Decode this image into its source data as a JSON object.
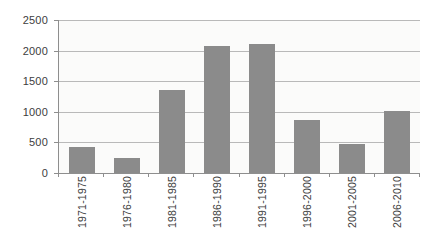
{
  "chart_data": {
    "type": "bar",
    "title": "",
    "xlabel": "",
    "ylabel": "",
    "categories": [
      "1971-1975",
      "1976-1980",
      "1981-1985",
      "1986-1990",
      "1991-1995",
      "1996-2000",
      "2001-2005",
      "2006-2010"
    ],
    "values": [
      430,
      240,
      1350,
      2070,
      2100,
      860,
      470,
      1020
    ],
    "ylim": [
      0,
      2500
    ],
    "ytick_interval": 500,
    "ytick_labels": [
      "0",
      "500",
      "1000",
      "1500",
      "2000",
      "2500"
    ],
    "grid": "horizontal",
    "legend": "none",
    "bar_color": "#8b8b8b",
    "gridline_color": "#b9b9b9",
    "axis_color": "#8e8e8e",
    "text_color": "#3d3d3d",
    "plot_background": "#fbfbfa",
    "background": "#ffffff"
  }
}
